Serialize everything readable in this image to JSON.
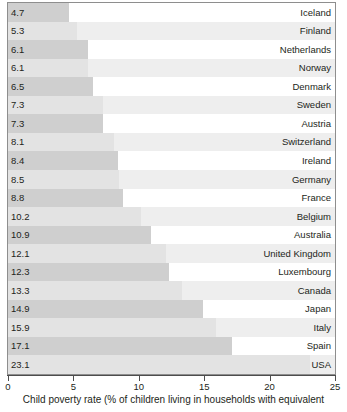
{
  "chart_data": {
    "type": "bar",
    "orientation": "horizontal",
    "title": "",
    "subtitle": "",
    "xlabel": "Child poverty rate (% of children living in households with equivalent",
    "ylabel": "",
    "xlim": [
      0,
      25
    ],
    "xticks": [
      0,
      5,
      10,
      15,
      20,
      25
    ],
    "xtick_labels": [
      "0",
      "5",
      "10",
      "15",
      "20",
      "25"
    ],
    "grid": false,
    "legend": null,
    "legend_position": "none",
    "value_labels_shown": true,
    "categories": [
      "Iceland",
      "Finland",
      "Netherlands",
      "Norway",
      "Denmark",
      "Sweden",
      "Austria",
      "Switzerland",
      "Ireland",
      "Germany",
      "France",
      "Belgium",
      "Australia",
      "United Kingdom",
      "Luxembourg",
      "Canada",
      "Japan",
      "Italy",
      "Spain",
      "USA"
    ],
    "values": [
      4.7,
      5.3,
      6.1,
      6.1,
      6.5,
      7.3,
      7.3,
      8.1,
      8.4,
      8.5,
      8.8,
      10.2,
      10.9,
      12.1,
      12.3,
      13.3,
      14.9,
      15.9,
      17.1,
      23.1
    ],
    "value_label_strings": [
      "4.7",
      "5.3",
      "6.1",
      "6.1",
      "6.5",
      "7.3",
      "7.3",
      "8.1",
      "8.4",
      "8.5",
      "8.8",
      "10.2",
      "10.9",
      "12.1",
      "12.3",
      "13.3",
      "14.9",
      "15.9",
      "17.1",
      "23.1"
    ],
    "colors": {
      "bar_on_white_row": "#cfcfcf",
      "bar_on_gray_row": "#e3e3e3",
      "row_band_white": "#ffffff",
      "row_band_gray": "#eeeeee",
      "frame": "#8e8e8e",
      "axis": "#4d4d4d",
      "text": "#231f20"
    }
  },
  "caption": {
    "x_axis_caption": "Child poverty rate (% of children living in households with equivalent"
  }
}
